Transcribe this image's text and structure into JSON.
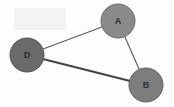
{
  "figure": {
    "kind": "node-link-graph",
    "width": 174,
    "height": 107,
    "background_color": "#fdfdfd",
    "title": ""
  },
  "chart_data": {
    "type": "diagram",
    "title": "",
    "subtitle": "",
    "xlabel": "",
    "ylabel": "",
    "grid": false,
    "legend": "none",
    "directed": false,
    "node_count": 3,
    "edge_count": 3,
    "nodes": [
      {
        "id": "A",
        "label": "A",
        "x": 118,
        "y": 21,
        "r": 17,
        "fill": "#8a8a8a",
        "stroke": "#6d6d6d",
        "stroke_width": 1,
        "label_color": "#2e2e2e"
      },
      {
        "id": "D",
        "label": "D",
        "x": 27,
        "y": 55,
        "r": 17,
        "fill": "#6a6a6a",
        "stroke": "#545454",
        "stroke_width": 1,
        "label_color": "#262626"
      },
      {
        "id": "B",
        "label": "B",
        "x": 146,
        "y": 85,
        "r": 17,
        "fill": "#7d7d7d",
        "stroke": "#626262",
        "stroke_width": 1,
        "label_color": "#2a2a2a"
      }
    ],
    "edges": [
      {
        "id": "D-A",
        "source": "D",
        "target": "A",
        "x1": 27,
        "y1": 55,
        "x2": 118,
        "y2": 21,
        "color": "#5a5a5a",
        "width": 1.1,
        "label": ""
      },
      {
        "id": "D-B",
        "source": "D",
        "target": "B",
        "x1": 27,
        "y1": 55,
        "x2": 146,
        "y2": 85,
        "color": "#444444",
        "width": 2.1,
        "label": ""
      },
      {
        "id": "A-B",
        "source": "A",
        "target": "B",
        "x1": 118,
        "y1": 21,
        "x2": 146,
        "y2": 85,
        "color": "#5a5a5a",
        "width": 1.1,
        "label": ""
      }
    ],
    "annotations": [
      {
        "id": "background-smudge",
        "kind": "faint-texture-patch",
        "x": 14,
        "y": 8,
        "width": 52,
        "height": 22,
        "color": "#f1f1f1"
      }
    ]
  }
}
